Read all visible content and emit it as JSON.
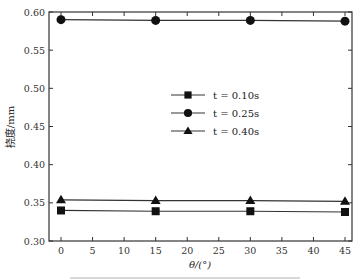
{
  "chart_data": {
    "type": "line",
    "title": "",
    "xlabel": "θ/(°)",
    "ylabel": "挠度/mm",
    "x": [
      0,
      15,
      30,
      45
    ],
    "xticks": [
      0,
      5,
      10,
      15,
      20,
      25,
      30,
      35,
      40,
      45
    ],
    "xtick_labels": [
      "0",
      "5",
      "10",
      "15",
      "20",
      "25",
      "30",
      "35",
      "40",
      "45"
    ],
    "yticks": [
      0.3,
      0.35,
      0.4,
      0.45,
      0.5,
      0.55,
      0.6
    ],
    "ytick_labels": [
      "0.30",
      "0.35",
      "0.40",
      "0.45",
      "0.50",
      "0.55",
      "0.60"
    ],
    "xlim": [
      -2,
      46.5
    ],
    "ylim": [
      0.3,
      0.6
    ],
    "grid": false,
    "legend_position": "center-right (inside plot)",
    "series": [
      {
        "name": "t = 0.10s",
        "marker": "square",
        "values": [
          0.34,
          0.339,
          0.339,
          0.338
        ]
      },
      {
        "name": "t = 0.25s",
        "marker": "circle",
        "values": [
          0.59,
          0.589,
          0.589,
          0.588
        ]
      },
      {
        "name": "t = 0.40s",
        "marker": "triangle",
        "values": [
          0.354,
          0.353,
          0.353,
          0.352
        ]
      }
    ]
  },
  "legend": {
    "items": [
      {
        "label": "t = 0.10s",
        "marker": "square"
      },
      {
        "label": "t = 0.25s",
        "marker": "circle"
      },
      {
        "label": "t = 0.40s",
        "marker": "triangle"
      }
    ]
  },
  "colors": {
    "line": "#333333",
    "marker": "#111111",
    "axis": "#333333"
  }
}
